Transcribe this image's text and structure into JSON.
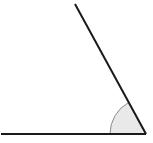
{
  "diagram": {
    "type": "angle",
    "vertex": {
      "x": 146,
      "y": 134
    },
    "ray_horizontal": {
      "x1": 1,
      "y1": 134,
      "x2": 146,
      "y2": 134
    },
    "ray_slanted": {
      "x1": 75,
      "y1": 4,
      "x2": 146,
      "y2": 134
    },
    "arc": {
      "radius": 36,
      "fill": "#e9e9e9",
      "stroke": "#8a8a8a"
    },
    "line_color": "#1a1a1a",
    "background": "#ffffff"
  }
}
